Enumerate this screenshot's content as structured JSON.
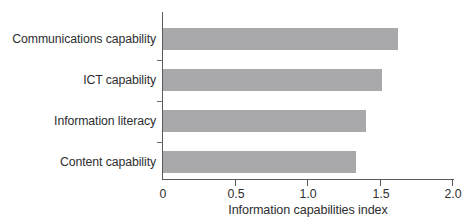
{
  "chart_data": {
    "type": "bar",
    "orientation": "horizontal",
    "title": "",
    "xlabel": "Information capabilities index",
    "ylabel": "",
    "categories": [
      "Communications capability",
      "ICT capability",
      "Information literacy",
      "Content capability"
    ],
    "values": [
      1.62,
      1.51,
      1.4,
      1.33
    ],
    "xlim": [
      0,
      2.0
    ],
    "xticks": [
      0,
      0.5,
      1.0,
      1.5,
      2.0
    ],
    "xtick_labels": [
      "0",
      "0.5",
      "1.0",
      "1.5",
      "2.0"
    ],
    "grid": false,
    "legend": null,
    "bar_color": "#a9a9ab",
    "axis_color": "#59595c",
    "text_color": "#2e2e30"
  }
}
